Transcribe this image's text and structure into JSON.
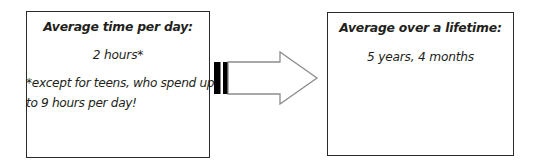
{
  "diagram": {
    "background_color": "#ffffff",
    "text_color": "#231f20",
    "border_color": "#2a2a2a"
  },
  "left_panel": {
    "heading": "Average time per day:",
    "value": "2 hours*",
    "note": "*except for teens, who spend up to 9 hours per day!"
  },
  "arrow": {
    "icon_name": "right-arrow",
    "direction": "right",
    "tail_color": "#000000",
    "outline_color": "#8c8c8c",
    "fill_color": "#ffffff"
  },
  "right_panel": {
    "heading": "Average over a lifetime:",
    "value": "5 years, 4 months"
  }
}
